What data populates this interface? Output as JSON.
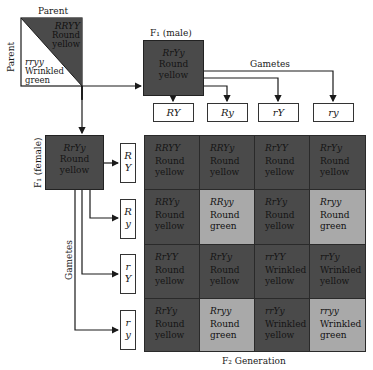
{
  "parent": {
    "top_label": "Parent",
    "side_label": "Parent",
    "dominant": {
      "genotype": "RRYY",
      "phenotype_line1": "Round",
      "phenotype_line2": "yellow"
    },
    "recessive": {
      "genotype": "rryy",
      "phenotype_line1": "Wrinkled",
      "phenotype_line2": "green"
    }
  },
  "f1_male": {
    "label": "F₁ (male)",
    "genotype": "RrYy",
    "phenotype_line1": "Round",
    "phenotype_line2": "yellow",
    "gametes_label": "Gametes",
    "gametes": [
      "RY",
      "Ry",
      "rY",
      "ry"
    ]
  },
  "f1_female": {
    "label": "F₁ (female)",
    "genotype": "RrYy",
    "phenotype_line1": "Round",
    "phenotype_line2": "yellow",
    "gametes_label": "Gametes",
    "gametes": [
      {
        "top": "R",
        "bottom": "Y"
      },
      {
        "top": "R",
        "bottom": "y"
      },
      {
        "top": "r",
        "bottom": "Y"
      },
      {
        "top": "r",
        "bottom": "y"
      }
    ]
  },
  "grid": {
    "rows": [
      [
        {
          "genotype": "RRYY",
          "shape": "Round",
          "color": "yellow",
          "shade": "dark"
        },
        {
          "genotype": "RRYy",
          "shape": "Round",
          "color": "yellow",
          "shade": "dark"
        },
        {
          "genotype": "RrYY",
          "shape": "Round",
          "color": "yellow",
          "shade": "dark"
        },
        {
          "genotype": "RrYy",
          "shape": "Round",
          "color": "yellow",
          "shade": "dark"
        }
      ],
      [
        {
          "genotype": "RRYy",
          "shape": "Round",
          "color": "yellow",
          "shade": "dark"
        },
        {
          "genotype": "RRyy",
          "shape": "Round",
          "color": "green",
          "shade": "light"
        },
        {
          "genotype": "RrYy",
          "shape": "Round",
          "color": "yellow",
          "shade": "dark"
        },
        {
          "genotype": "Rryy",
          "shape": "Round",
          "color": "green",
          "shade": "light"
        }
      ],
      [
        {
          "genotype": "RrYY",
          "shape": "Round",
          "color": "yellow",
          "shade": "dark"
        },
        {
          "genotype": "RrYy",
          "shape": "Round",
          "color": "yellow",
          "shade": "dark"
        },
        {
          "genotype": "rrYY",
          "shape": "Wrinkled",
          "color": "yellow",
          "shade": "dark"
        },
        {
          "genotype": "rrYy",
          "shape": "Wrinkled",
          "color": "yellow",
          "shade": "dark"
        }
      ],
      [
        {
          "genotype": "RrYy",
          "shape": "Round",
          "color": "yellow",
          "shade": "dark"
        },
        {
          "genotype": "Rryy",
          "shape": "Round",
          "color": "green",
          "shade": "light"
        },
        {
          "genotype": "rrYy",
          "shape": "Wrinkled",
          "color": "yellow",
          "shade": "dark"
        },
        {
          "genotype": "rryy",
          "shape": "Wrinkled",
          "color": "green",
          "shade": "light"
        }
      ]
    ],
    "caption": "F₂ Generation"
  },
  "colors": {
    "dark_cell": "#4a4a4a",
    "light_cell": "#a9a9a9",
    "line": "#1a1a1a"
  }
}
